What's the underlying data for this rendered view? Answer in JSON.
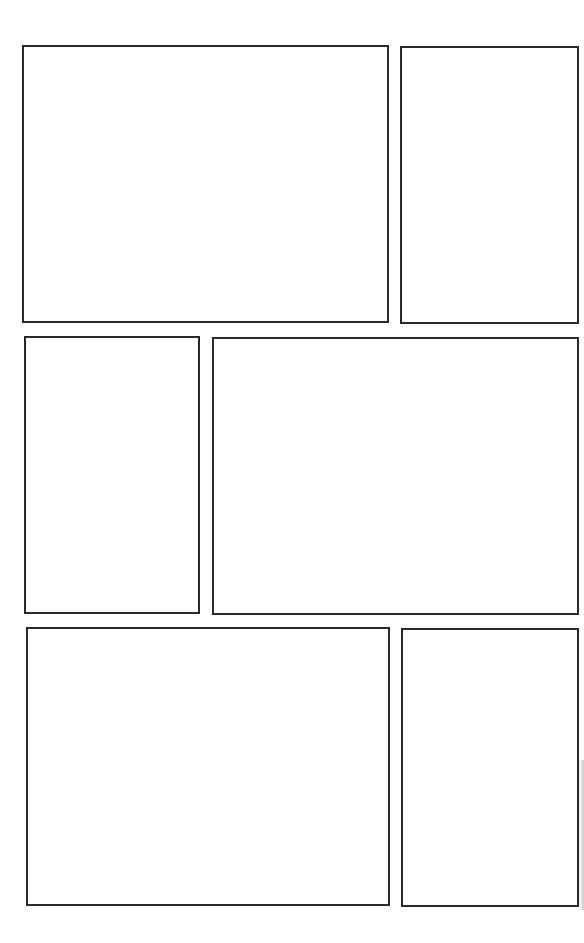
{
  "page": {
    "type": "comic-panel-template",
    "background": "#ffffff",
    "border_color": "#2a2a2a",
    "panels": [
      {
        "id": "panel-1",
        "x": 22,
        "y": 45,
        "w": 367,
        "h": 278
      },
      {
        "id": "panel-2",
        "x": 400,
        "y": 46,
        "w": 179,
        "h": 278
      },
      {
        "id": "panel-3",
        "x": 24,
        "y": 336,
        "w": 176,
        "h": 278
      },
      {
        "id": "panel-4",
        "x": 212,
        "y": 337,
        "w": 367,
        "h": 278
      },
      {
        "id": "panel-5",
        "x": 26,
        "y": 627,
        "w": 364,
        "h": 279
      },
      {
        "id": "panel-6",
        "x": 401,
        "y": 628,
        "w": 178,
        "h": 279
      }
    ]
  }
}
